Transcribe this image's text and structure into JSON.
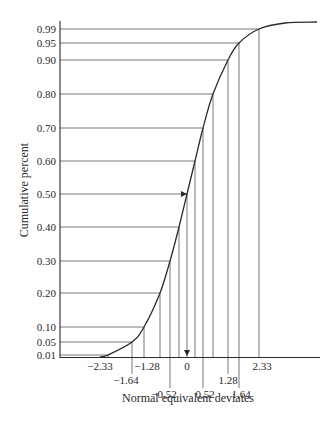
{
  "chart_data": {
    "type": "line",
    "title": "",
    "xlabel": "Normal equivalent deviates",
    "ylabel": "Cumulative percent",
    "grid": false,
    "legend": null,
    "y_ticks": [
      "0.01",
      "0.05",
      "0.10",
      "0.20",
      "0.30",
      "0.40",
      "0.50",
      "0.60",
      "0.70",
      "0.80",
      "0.90",
      "0.95",
      "0.99"
    ],
    "x_tick_labels": [
      "-2.33",
      "-1.64",
      "-1.28",
      "-0.52",
      "0",
      "0.52",
      "1.28",
      "1.64",
      "2.33"
    ],
    "series": [
      {
        "name": "Cumulative normal curve",
        "points": [
          {
            "y": 0.01,
            "x": -2.33
          },
          {
            "y": 0.05,
            "x": -1.64
          },
          {
            "y": 0.1,
            "x": -1.28
          },
          {
            "y": 0.2,
            "x": -0.84
          },
          {
            "y": 0.3,
            "x": -0.52
          },
          {
            "y": 0.4,
            "x": -0.25
          },
          {
            "y": 0.5,
            "x": 0
          },
          {
            "y": 0.6,
            "x": 0.25
          },
          {
            "y": 0.7,
            "x": 0.52
          },
          {
            "y": 0.8,
            "x": 0.84
          },
          {
            "y": 0.9,
            "x": 1.28
          },
          {
            "y": 0.95,
            "x": 1.64
          },
          {
            "y": 0.99,
            "x": 2.33
          }
        ]
      }
    ],
    "annotations": [
      {
        "type": "arrow",
        "at": "0.50 horizontal line meeting curve"
      },
      {
        "type": "arrow",
        "at": "0 vertical line meeting x-axis"
      }
    ]
  },
  "layout": {
    "y_px": {
      "0.01": 355,
      "0.05": 342,
      "0.10": 327,
      "0.20": 293,
      "0.30": 261,
      "0.40": 227,
      "0.50": 194,
      "0.60": 161,
      "0.70": 128,
      "0.80": 94,
      "0.90": 60,
      "0.95": 43,
      "0.99": 29
    },
    "cross_x_px": {
      "0.01": 108,
      "0.05": 132,
      "0.10": 144,
      "0.20": 160,
      "0.30": 170,
      "0.40": 179,
      "0.50": 187,
      "0.60": 195,
      "0.70": 203,
      "0.80": 213,
      "0.90": 228,
      "0.95": 239,
      "0.99": 259
    },
    "x_labels": [
      {
        "text": "−2.33",
        "x": 100,
        "row": 0,
        "drop": false
      },
      {
        "text": "−1.64",
        "x": 126,
        "row": 1,
        "drop": true,
        "line_x": 132
      },
      {
        "text": "−1.28",
        "x": 147,
        "row": 0,
        "drop": false
      },
      {
        "text": "−0.52",
        "x": 164,
        "row": 2,
        "drop": true,
        "line_x": 170
      },
      {
        "text": "0",
        "x": 187,
        "row": 0,
        "drop": false
      },
      {
        "text": "0.52",
        "x": 205,
        "row": 2,
        "drop": true,
        "line_x": 203
      },
      {
        "text": "1.28",
        "x": 228,
        "row": 1,
        "drop": true,
        "line_x": 228
      },
      {
        "text": "1.64",
        "x": 241,
        "row": 2,
        "drop": true,
        "line_x": 239
      },
      {
        "text": "2.33",
        "x": 262,
        "row": 0,
        "drop": false
      }
    ],
    "colors": {
      "line": "#2a2a2a",
      "grid": "#555555"
    }
  }
}
